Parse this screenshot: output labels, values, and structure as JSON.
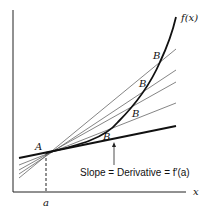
{
  "diagram": {
    "labels": {
      "function": "f(x)",
      "point_a": "A",
      "point_b": "B",
      "x_axis": "x",
      "a_tick": "a",
      "annotation": "Slope = Derivative = f′(a)"
    },
    "colors": {
      "axis": "#222222",
      "curve": "#111111",
      "secant": "#555555",
      "tangent": "#111111",
      "background": "#ffffff"
    },
    "b_labels": [
      {
        "text": "B",
        "x": 158,
        "y": 56
      },
      {
        "text": "B",
        "x": 142,
        "y": 84
      },
      {
        "text": "B",
        "x": 135,
        "y": 114
      },
      {
        "text": "B",
        "x": 106,
        "y": 137
      }
    ],
    "secant_count": 4
  }
}
